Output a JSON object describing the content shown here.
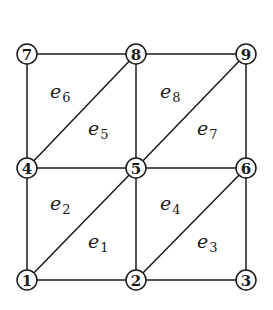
{
  "diagram": {
    "type": "finite-element-mesh",
    "colors": {
      "line": "#1a1a1a",
      "background": "#ffffff"
    },
    "nodes": [
      {
        "id": "1",
        "label": "1",
        "x": 27,
        "y": 280
      },
      {
        "id": "2",
        "label": "2",
        "x": 136,
        "y": 280
      },
      {
        "id": "3",
        "label": "3",
        "x": 246,
        "y": 280
      },
      {
        "id": "4",
        "label": "4",
        "x": 27,
        "y": 168
      },
      {
        "id": "5",
        "label": "5",
        "x": 136,
        "y": 168
      },
      {
        "id": "6",
        "label": "6",
        "x": 246,
        "y": 168
      },
      {
        "id": "7",
        "label": "7",
        "x": 27,
        "y": 54
      },
      {
        "id": "8",
        "label": "8",
        "x": 136,
        "y": 54
      },
      {
        "id": "9",
        "label": "9",
        "x": 246,
        "y": 54
      }
    ],
    "edges": [
      [
        "1",
        "2"
      ],
      [
        "2",
        "3"
      ],
      [
        "4",
        "5"
      ],
      [
        "5",
        "6"
      ],
      [
        "7",
        "8"
      ],
      [
        "8",
        "9"
      ],
      [
        "1",
        "4"
      ],
      [
        "4",
        "7"
      ],
      [
        "2",
        "5"
      ],
      [
        "5",
        "8"
      ],
      [
        "3",
        "6"
      ],
      [
        "6",
        "9"
      ],
      [
        "1",
        "5"
      ],
      [
        "2",
        "6"
      ],
      [
        "4",
        "8"
      ],
      [
        "5",
        "9"
      ]
    ],
    "elements": [
      {
        "id": "e1",
        "base": "e",
        "sub": "1",
        "x": 88,
        "y": 248
      },
      {
        "id": "e2",
        "base": "e",
        "sub": "2",
        "x": 50,
        "y": 210
      },
      {
        "id": "e3",
        "base": "e",
        "sub": "3",
        "x": 197,
        "y": 248
      },
      {
        "id": "e4",
        "base": "e",
        "sub": "4",
        "x": 160,
        "y": 210
      },
      {
        "id": "e5",
        "base": "e",
        "sub": "5",
        "x": 88,
        "y": 135
      },
      {
        "id": "e6",
        "base": "e",
        "sub": "6",
        "x": 50,
        "y": 98
      },
      {
        "id": "e7",
        "base": "e",
        "sub": "7",
        "x": 197,
        "y": 135
      },
      {
        "id": "e8",
        "base": "e",
        "sub": "8",
        "x": 160,
        "y": 98
      }
    ]
  }
}
